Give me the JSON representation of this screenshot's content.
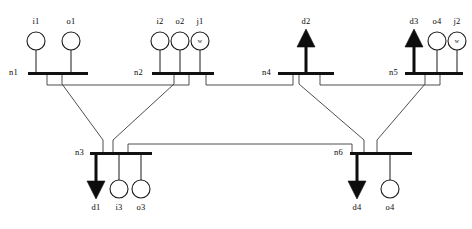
{
  "diagram": {
    "type": "single-line-diagram",
    "canvas": {
      "width": 472,
      "height": 229
    },
    "colors": {
      "background": "#ffffff",
      "bus": "#111111",
      "line": "#3a3a3a",
      "load": "#0d0d0d",
      "unit_outline": "#1a1a1a"
    },
    "buses": [
      {
        "id": "n1",
        "label": "n1",
        "label_x": 18,
        "label_y": 73,
        "bar_x": 28,
        "bar_y": 72,
        "bar_w": 60,
        "bar_h": 3
      },
      {
        "id": "n2",
        "label": "n2",
        "label_x": 143,
        "label_y": 73,
        "bar_x": 152,
        "bar_y": 72,
        "bar_w": 62,
        "bar_h": 3
      },
      {
        "id": "n3",
        "label": "n3",
        "label_x": 84,
        "label_y": 153,
        "bar_x": 90,
        "bar_y": 152,
        "bar_w": 62,
        "bar_h": 3
      },
      {
        "id": "n4",
        "label": "n4",
        "label_x": 271,
        "label_y": 73,
        "bar_x": 278,
        "bar_y": 72,
        "bar_w": 56,
        "bar_h": 3
      },
      {
        "id": "n5",
        "label": "n5",
        "label_x": 398,
        "label_y": 73,
        "bar_x": 405,
        "bar_y": 72,
        "bar_w": 58,
        "bar_h": 3
      },
      {
        "id": "n6",
        "label": "n6",
        "label_x": 343,
        "label_y": 153,
        "bar_x": 350,
        "bar_y": 152,
        "bar_w": 62,
        "bar_h": 3
      }
    ],
    "units": [
      {
        "id": "i1",
        "label": "i1",
        "kind": "generator",
        "bus": "n1",
        "x": 36,
        "cy": 41,
        "r": 9,
        "label_y": 22,
        "stub_from": 50,
        "stub_to": 72
      },
      {
        "id": "o1",
        "label": "o1",
        "kind": "generator",
        "bus": "n1",
        "x": 71,
        "cy": 41,
        "r": 9,
        "label_y": 22,
        "stub_from": 50,
        "stub_to": 72
      },
      {
        "id": "i2",
        "label": "i2",
        "kind": "generator",
        "bus": "n2",
        "x": 160,
        "cy": 41,
        "r": 9,
        "label_y": 22,
        "stub_from": 50,
        "stub_to": 72
      },
      {
        "id": "o2",
        "label": "o2",
        "kind": "generator",
        "bus": "n2",
        "x": 180,
        "cy": 41,
        "r": 9,
        "label_y": 22,
        "stub_from": 50,
        "stub_to": 72
      },
      {
        "id": "j1",
        "label": "j1",
        "kind": "wind",
        "bus": "n2",
        "x": 200,
        "cy": 41,
        "r": 9,
        "label_y": 22,
        "stub_from": 50,
        "stub_to": 72,
        "glyph": "w"
      },
      {
        "id": "o4t",
        "label": "o4",
        "kind": "generator",
        "bus": "n5",
        "x": 437,
        "cy": 41,
        "r": 9,
        "label_y": 22,
        "stub_from": 50,
        "stub_to": 72
      },
      {
        "id": "j2",
        "label": "j2",
        "kind": "wind",
        "bus": "n5",
        "x": 457,
        "cy": 41,
        "r": 9,
        "label_y": 22,
        "stub_from": 50,
        "stub_to": 72,
        "glyph": "w"
      },
      {
        "id": "i3",
        "label": "i3",
        "kind": "generator",
        "bus": "n3",
        "x": 119,
        "cy": 189,
        "r": 9,
        "label_y": 208,
        "stub_from": 155,
        "stub_to": 180
      },
      {
        "id": "o3",
        "label": "o3",
        "kind": "generator",
        "bus": "n3",
        "x": 141,
        "cy": 189,
        "r": 9,
        "label_y": 208,
        "stub_from": 155,
        "stub_to": 180
      },
      {
        "id": "o4b",
        "label": "o4",
        "kind": "generator",
        "bus": "n6",
        "x": 390,
        "cy": 189,
        "r": 9,
        "label_y": 208,
        "stub_from": 155,
        "stub_to": 180
      }
    ],
    "loads": [
      {
        "id": "d2",
        "label": "d2",
        "bus": "n4",
        "x": 306,
        "direction": "up",
        "label_y": 22,
        "tip": 29,
        "base": 47,
        "shaft_to": 72,
        "half_w": 9
      },
      {
        "id": "d3",
        "label": "d3",
        "bus": "n5",
        "x": 414,
        "direction": "up",
        "label_y": 22,
        "tip": 29,
        "base": 47,
        "shaft_to": 72,
        "half_w": 9
      },
      {
        "id": "d1",
        "label": "d1",
        "bus": "n3",
        "x": 96,
        "direction": "down",
        "label_y": 208,
        "tip": 199,
        "base": 181,
        "shaft_to": 155,
        "half_w": 9
      },
      {
        "id": "d4",
        "label": "d4",
        "bus": "n6",
        "x": 357,
        "direction": "down",
        "label_y": 208,
        "tip": 199,
        "base": 181,
        "shaft_to": 155,
        "half_w": 9
      }
    ],
    "tie_lines": [
      {
        "id": "n1-n2",
        "from": "n1",
        "to": "n2",
        "path": "M 47 75 L 47 85 L 189 85 L 189 75"
      },
      {
        "id": "n2-n4",
        "from": "n2",
        "to": "n4",
        "path": "M 206 75 L 206 85 L 293 85 L 293 75"
      },
      {
        "id": "n4-n5",
        "from": "n4",
        "to": "n5",
        "path": "M 320 75 L 320 85 L 440 85 L 440 75"
      },
      {
        "id": "n1-n3",
        "from": "n1",
        "to": "n3",
        "path": "M 62 75 L 62 84 L 103 140 L 103 152"
      },
      {
        "id": "n2-n3",
        "from": "n2",
        "to": "n3",
        "path": "M 174 75 L 174 84 L 113 140 L 113 152"
      },
      {
        "id": "n4-n6",
        "from": "n4",
        "to": "n6",
        "path": "M 299 75 L 299 84 L 364 140 L 364 152"
      },
      {
        "id": "n5-n6",
        "from": "n5",
        "to": "n6",
        "path": "M 425 75 L 425 84 L 377 140 L 377 152"
      },
      {
        "id": "n3-n6",
        "from": "n3",
        "to": "n6",
        "path": "M 128 152 L 128 144 L 352 144 L 352 152"
      }
    ]
  }
}
